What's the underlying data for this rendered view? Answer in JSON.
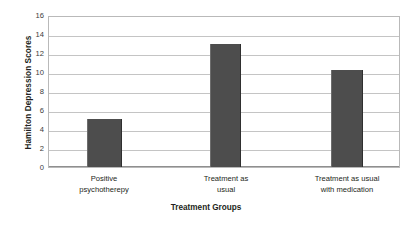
{
  "chart_data": {
    "type": "bar",
    "title": "",
    "xlabel": "Treatment Groups",
    "ylabel": "Hamilton Depression Scores",
    "categories": [
      "Positive psychotherepy",
      "Treatment as usual",
      "Treatment as usual with medication"
    ],
    "values": [
      5.1,
      13.0,
      10.3
    ],
    "ylim": [
      0,
      16
    ],
    "ytick_values": [
      0,
      2,
      4,
      6,
      8,
      10,
      12,
      14,
      16
    ],
    "ytick_labels": [
      "0",
      "2",
      "4",
      "6",
      "8",
      "10",
      "12",
      "14",
      "16"
    ],
    "grid": true,
    "legend": "none",
    "bar_color": "#4d4d4d",
    "gridline_color": "#c4c4c4",
    "plot_border_color": "#b9b9b9"
  },
  "axes": {
    "y_title": "Hamilton Depression Scores",
    "x_title": "Treatment Groups"
  },
  "categories": [
    {
      "line1": "Positive",
      "line2": "psychotherepy"
    },
    {
      "line1": "Treatment as",
      "line2": "usual"
    },
    {
      "line1": "Treatment as usual",
      "line2": "with medication"
    }
  ],
  "yticks": [
    {
      "label": "16"
    },
    {
      "label": "14"
    },
    {
      "label": "12"
    },
    {
      "label": "10"
    },
    {
      "label": "8"
    },
    {
      "label": "6"
    },
    {
      "label": "4"
    },
    {
      "label": "2"
    },
    {
      "label": "0"
    }
  ]
}
